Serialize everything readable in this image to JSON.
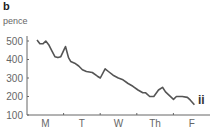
{
  "figure": {
    "panel_label": "b",
    "y_unit": "pence",
    "series_label": "ii",
    "line_color": "#555555",
    "axis_color": "#666666"
  },
  "chart_data": {
    "type": "line",
    "title": "",
    "xlabel": "",
    "ylabel": "pence",
    "ylim": [
      100,
      500
    ],
    "yticks": [
      100,
      200,
      300,
      400,
      500
    ],
    "categories": [
      "M",
      "T",
      "W",
      "Th",
      "F"
    ],
    "legend": [],
    "annotations": [
      "ii"
    ],
    "grid": false,
    "series": [
      {
        "name": "ii",
        "x": [
          0.0,
          0.08,
          0.16,
          0.24,
          0.32,
          0.41,
          0.49,
          0.57,
          0.65,
          0.73,
          0.78,
          0.86,
          0.92,
          1.03,
          1.14,
          1.24,
          1.35,
          1.51,
          1.65,
          1.73,
          1.86,
          1.95,
          2.08,
          2.22,
          2.35,
          2.49,
          2.62,
          2.76,
          2.89,
          2.97,
          3.08,
          3.19,
          3.32,
          3.43,
          3.51,
          3.62,
          3.73,
          3.81,
          3.97,
          4.11,
          4.19,
          4.3
        ],
        "values": [
          505,
          485,
          485,
          500,
          480,
          445,
          415,
          410,
          415,
          450,
          470,
          410,
          390,
          380,
          365,
          345,
          335,
          330,
          310,
          300,
          350,
          335,
          315,
          300,
          290,
          270,
          255,
          235,
          220,
          220,
          200,
          200,
          235,
          250,
          225,
          205,
          185,
          200,
          200,
          195,
          180,
          155
        ]
      }
    ]
  }
}
